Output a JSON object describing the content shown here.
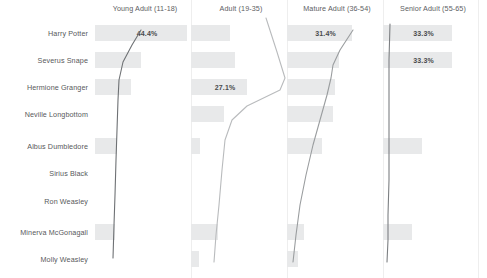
{
  "chart_data": {
    "type": "bar",
    "title": "",
    "xlabel": "",
    "ylabel": "",
    "grid": false,
    "legend": "none",
    "orientation": "horizontal",
    "layout": "small-multiples: 9 character rows x 4 age-group columns",
    "categories": [
      "Harry Potter",
      "Severus Snape",
      "Hermione Granger",
      "Neville Longbottom",
      "Albus Dumbledore",
      "Sirius Black",
      "Ron Weasley",
      "Minerva McGonagall",
      "Molly Weasley"
    ],
    "column_labels": [
      "Young Adult (11-18)",
      "Adult (19-35)",
      "Mature Adult (36-54)",
      "Senior Adult (55-65)"
    ],
    "series": [
      {
        "name": "Young Adult (11-18)",
        "values": [
          44.4,
          22.0,
          17.5,
          0.0,
          10.5,
          0.0,
          0.0,
          9.5,
          0.0
        ],
        "labels": [
          "44.4%",
          "",
          "",
          "",
          "",
          "",
          "",
          "",
          ""
        ]
      },
      {
        "name": "Adult (19-35)",
        "values": [
          19.0,
          21.0,
          27.1,
          16.0,
          4.5,
          0.0,
          0.0,
          13.0,
          4.0
        ],
        "labels": [
          "",
          "",
          "27.1%",
          "",
          "",
          "",
          "",
          "",
          ""
        ]
      },
      {
        "name": "Mature Adult (36-54)",
        "values": [
          31.4,
          25.0,
          23.0,
          22.0,
          17.0,
          0.0,
          0.0,
          8.0,
          5.5
        ],
        "labels": [
          "31.4%",
          "",
          "",
          "",
          "",
          "",
          "",
          "",
          ""
        ]
      },
      {
        "name": "Senior Adult (55-65)",
        "values": [
          33.3,
          33.3,
          0.0,
          0.0,
          19.0,
          0.0,
          0.0,
          14.0,
          0.0
        ],
        "labels": [
          "33.3%",
          "33.3%",
          "",
          "",
          "",
          "",
          "",
          "",
          ""
        ]
      }
    ],
    "value_suffix": "%",
    "bar_color": "#e8e9ea",
    "label_color": "#4a4b4d",
    "line_color": "#6e7174",
    "axis_text_color": "#5d6063",
    "background": "#ffffff"
  },
  "chart": {
    "columns": [
      {
        "label": "Young Adult (11-18)",
        "center_x": 145
      },
      {
        "label": "Adult (19-35)",
        "center_x": 241
      },
      {
        "label": "Mature Adult (36-54)",
        "center_x": 337
      },
      {
        "label": "Senior Adult (55-65)",
        "center_x": 433
      }
    ],
    "rows": [
      {
        "label": "Harry Potter",
        "center_y": 33
      },
      {
        "label": "Severus Snape",
        "center_y": 60
      },
      {
        "label": "Hermione Granger",
        "center_y": 87
      },
      {
        "label": "Neville Longbottom",
        "center_y": 114
      },
      {
        "label": "Albus Dumbledore",
        "center_y": 146
      },
      {
        "label": "Sirius Black",
        "center_y": 173
      },
      {
        "label": "Ron Weasley",
        "center_y": 201
      },
      {
        "label": "Minerva McGonagall",
        "center_y": 232
      },
      {
        "label": "Molly Weasley",
        "center_y": 259
      }
    ]
  }
}
